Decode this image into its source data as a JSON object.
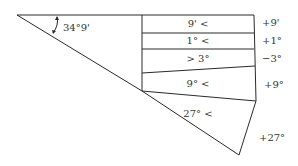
{
  "diagram": {
    "angle_label": "34°9'",
    "rows": [
      {
        "inside": "9' <",
        "outside": "+9'"
      },
      {
        "inside": "1° <",
        "outside": "+1°"
      },
      {
        "inside": "> 3°",
        "outside": "−3°"
      },
      {
        "inside": "9° <",
        "outside": "+9°"
      },
      {
        "inside": "27° <",
        "outside": "+27°"
      }
    ]
  }
}
